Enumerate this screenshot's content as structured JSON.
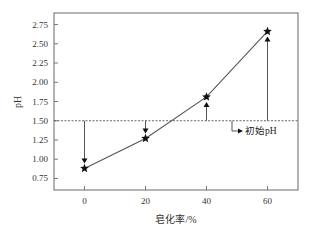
{
  "chart_data": {
    "type": "line",
    "title": "",
    "xlabel": "皂化率/%",
    "ylabel": "pH",
    "x": [
      0,
      20,
      40,
      60
    ],
    "series": [
      {
        "name": "pH",
        "marker": "star",
        "values": [
          0.88,
          1.27,
          1.81,
          2.66
        ]
      }
    ],
    "reference_line": {
      "y": 1.5,
      "style": "dotted",
      "label": "初始pH"
    },
    "arrows_from_reference": [
      {
        "x": 0,
        "from": 1.5,
        "to": 0.88,
        "direction": "down"
      },
      {
        "x": 20,
        "from": 1.5,
        "to": 1.27,
        "direction": "down"
      },
      {
        "x": 40,
        "from": 1.5,
        "to": 1.81,
        "direction": "up"
      },
      {
        "x": 60,
        "from": 1.5,
        "to": 2.66,
        "direction": "up"
      }
    ],
    "xticks": [
      0,
      20,
      40,
      60
    ],
    "xtick_labels": [
      "0",
      "20",
      "40",
      "60"
    ],
    "yticks": [
      0.75,
      1.0,
      1.25,
      1.5,
      1.75,
      2.0,
      2.25,
      2.5,
      2.75
    ],
    "ytick_labels": [
      "0.75",
      "1.00",
      "1.25",
      "1.50",
      "1.75",
      "2.00",
      "2.25",
      "2.50",
      "2.75"
    ],
    "xlim": [
      -10,
      70
    ],
    "ylim": [
      0.6,
      2.9
    ],
    "grid": false,
    "legend": null
  },
  "colors": {
    "line": "#555555",
    "axis": "#777777",
    "marker": "#111111",
    "text": "#333333"
  }
}
